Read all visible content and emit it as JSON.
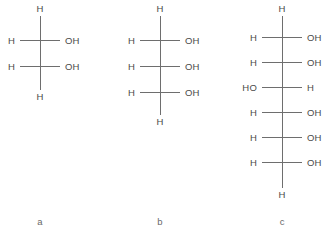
{
  "figure": {
    "background_color": "#ffffff",
    "bond_color": "#6e6e6e",
    "text_color": "#4a4a4a",
    "caption_color": "#6a6a6a",
    "width": 329,
    "height": 238
  },
  "structures": [
    {
      "id": "a",
      "caption": "a",
      "axis_x": 40,
      "caption_x": 40,
      "caption_y": 222,
      "backbone_top": 16,
      "backbone_bottom": 90,
      "cap_top": {
        "label": "H",
        "y": 9
      },
      "cap_bottom": {
        "label": "H",
        "y": 97
      },
      "rows": [
        {
          "y": 40,
          "left": "H",
          "right": "OH"
        },
        {
          "y": 66,
          "left": "H",
          "right": "OH"
        }
      ],
      "bond_left_len": 20,
      "bond_right_len": 20,
      "label_gap_left": 25,
      "label_gap_right": 25
    },
    {
      "id": "b",
      "caption": "b",
      "axis_x": 160,
      "caption_x": 160,
      "caption_y": 222,
      "backbone_top": 16,
      "backbone_bottom": 115,
      "cap_top": {
        "label": "H",
        "y": 9
      },
      "cap_bottom": {
        "label": "H",
        "y": 122
      },
      "rows": [
        {
          "y": 40,
          "left": "H",
          "right": "OH"
        },
        {
          "y": 66,
          "left": "H",
          "right": "OH"
        },
        {
          "y": 92,
          "left": "H",
          "right": "OH"
        }
      ],
      "bond_left_len": 20,
      "bond_right_len": 20,
      "label_gap_left": 25,
      "label_gap_right": 25
    },
    {
      "id": "c",
      "caption": "c",
      "axis_x": 282,
      "caption_x": 282,
      "caption_y": 222,
      "backbone_top": 16,
      "backbone_bottom": 188,
      "cap_top": {
        "label": "H",
        "y": 9
      },
      "cap_bottom": {
        "label": "H",
        "y": 195
      },
      "rows": [
        {
          "y": 37,
          "left": "H",
          "right": "OH"
        },
        {
          "y": 62,
          "left": "H",
          "right": "OH"
        },
        {
          "y": 87,
          "left": "HO",
          "right": "H"
        },
        {
          "y": 112,
          "left": "H",
          "right": "OH"
        },
        {
          "y": 137,
          "left": "H",
          "right": "OH"
        },
        {
          "y": 162,
          "left": "H",
          "right": "OH"
        }
      ],
      "bond_left_len": 20,
      "bond_right_len": 20,
      "label_gap_left": 25,
      "label_gap_right": 25
    }
  ]
}
